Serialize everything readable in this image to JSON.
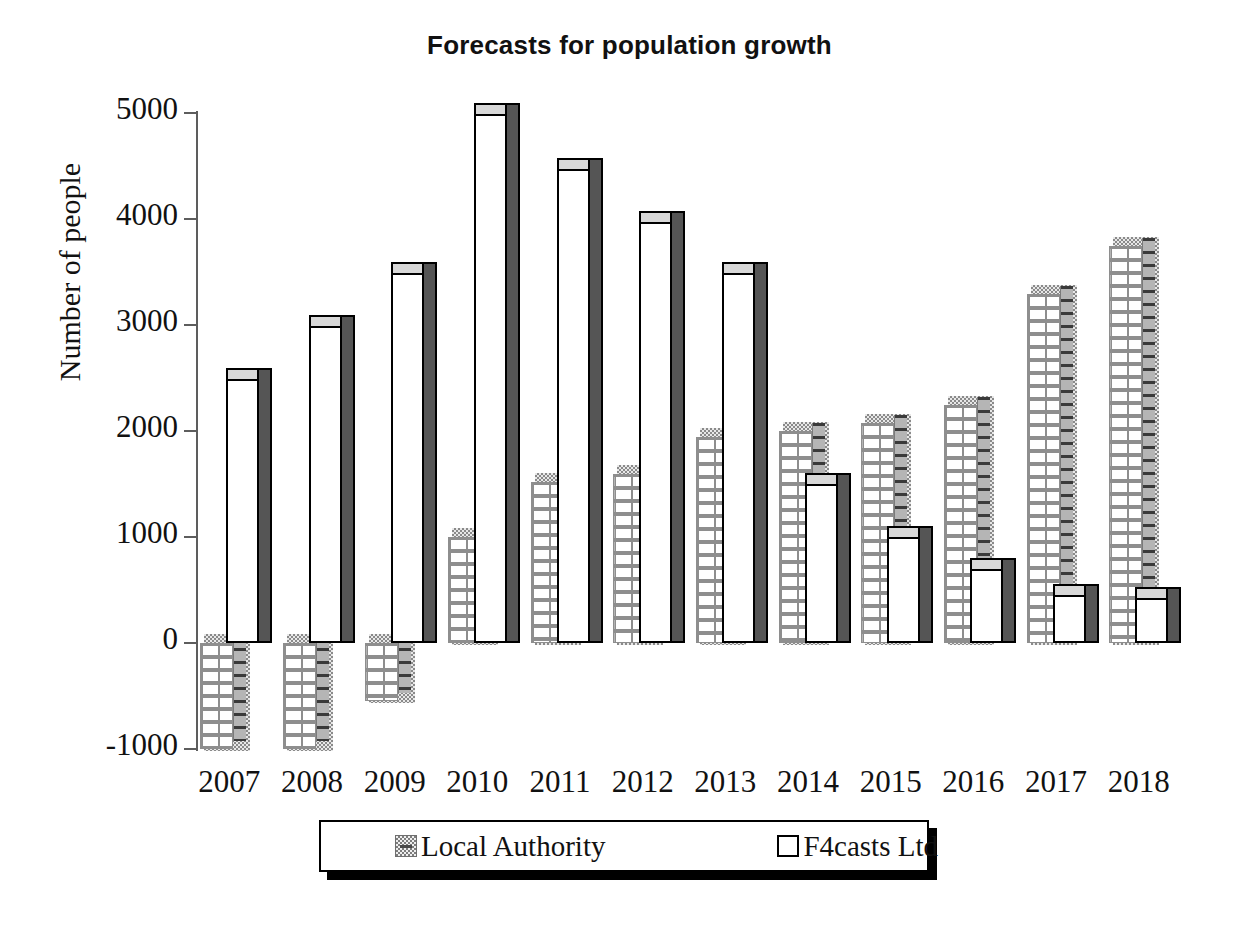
{
  "chart_data": {
    "type": "bar",
    "title": "Forecasts for population growth",
    "xlabel": "",
    "ylabel": "Number of people",
    "categories": [
      "2007",
      "2008",
      "2009",
      "2010",
      "2011",
      "2012",
      "2013",
      "2014",
      "2015",
      "2016",
      "2017",
      "2018"
    ],
    "ylim": [
      -1000,
      5000
    ],
    "ytick_labels": [
      "5000",
      "4000",
      "3000",
      "2000",
      "1000",
      "0",
      "-1000"
    ],
    "yticks": [
      5000,
      4000,
      3000,
      2000,
      1000,
      0,
      -1000
    ],
    "grid": false,
    "legend_position": "bottom",
    "style": "3d-clustered-column",
    "series": [
      {
        "name": "Local Authority",
        "color": "#bdbdbd",
        "pattern": "brick",
        "values": [
          -1000,
          -1000,
          -550,
          1000,
          1520,
          1600,
          1950,
          2000,
          2080,
          2250,
          3300,
          3750
        ]
      },
      {
        "name": "F4casts Ltd",
        "color": "#ffffff",
        "pattern": "solid",
        "values": [
          2500,
          3000,
          3500,
          5000,
          4480,
          3980,
          3500,
          1500,
          1000,
          700,
          450,
          430
        ]
      }
    ]
  },
  "legend": {
    "items": [
      {
        "label": "Local Authority",
        "swatch": "brick-gray-swatch"
      },
      {
        "label": "F4casts Ltd",
        "swatch": "white-outline-swatch"
      }
    ]
  },
  "colors": {
    "bar_local_authority": "#bdbdbd",
    "bar_f4casts": "#ffffff",
    "bar_side_dark": "#555555",
    "axis": "#5d5d5d",
    "text": "#111111",
    "background": "#ffffff"
  }
}
